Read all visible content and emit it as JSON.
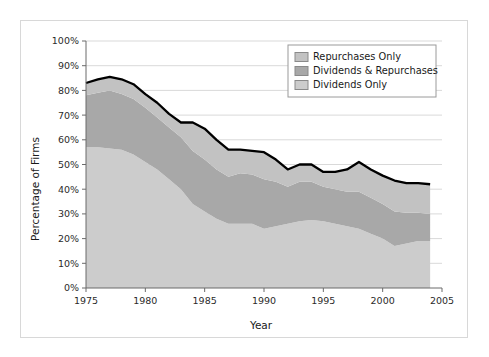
{
  "figure": {
    "background": "#ffffff",
    "border_color": "#d8d8d8"
  },
  "axis": {
    "y_title": "Percentage of Firms",
    "x_title": "Year",
    "y_ticks": [
      "0%",
      "10%",
      "20%",
      "30%",
      "40%",
      "50%",
      "60%",
      "70%",
      "80%",
      "90%",
      "100%"
    ],
    "x_ticks": [
      "1975",
      "1980",
      "1985",
      "1990",
      "1995",
      "2000",
      "2005"
    ]
  },
  "legend": {
    "position": "top-right",
    "items": [
      {
        "label": "Repurchases Only",
        "color": "#c2c2c2"
      },
      {
        "label": "Dividends & Repurchases",
        "color": "#a8a8a8"
      },
      {
        "label": "Dividends Only",
        "color": "#cccccc"
      }
    ]
  },
  "chart_data": {
    "type": "area",
    "stacked": true,
    "title": "",
    "xlabel": "Year",
    "ylabel": "Percentage of Firms",
    "xlim": [
      1975,
      2005
    ],
    "ylim": [
      0,
      100
    ],
    "y_unit": "percent",
    "grid": "horizontal",
    "legend_position": "top-right",
    "x": [
      1975,
      1976,
      1977,
      1978,
      1979,
      1980,
      1981,
      1982,
      1983,
      1984,
      1985,
      1986,
      1987,
      1988,
      1989,
      1990,
      1991,
      1992,
      1993,
      1994,
      1995,
      1996,
      1997,
      1998,
      1999,
      2000,
      2001,
      2002,
      2003,
      2004
    ],
    "series": [
      {
        "name": "Dividends Only",
        "color": "#cccccc",
        "values": [
          57.0,
          57.0,
          56.5,
          56.0,
          54.0,
          51.0,
          48.0,
          44.0,
          40.0,
          34.0,
          31.0,
          28.0,
          26.0,
          26.0,
          26.0,
          24.0,
          25.0,
          26.0,
          27.0,
          27.5,
          27.0,
          26.0,
          25.0,
          24.0,
          22.0,
          20.0,
          17.0,
          18.0,
          19.0,
          19.0
        ]
      },
      {
        "name": "Dividends & Repurchases",
        "color": "#a8a8a8",
        "values": [
          21.0,
          22.0,
          23.5,
          22.5,
          22.5,
          22.0,
          21.0,
          21.0,
          21.0,
          21.5,
          21.0,
          20.0,
          19.0,
          20.5,
          20.0,
          20.0,
          18.0,
          15.0,
          16.0,
          15.5,
          14.0,
          14.0,
          14.0,
          15.0,
          14.5,
          14.0,
          14.0,
          12.5,
          11.5,
          11.0
        ]
      },
      {
        "name": "Repurchases Only",
        "color": "#c2c2c2",
        "values": [
          5.0,
          5.5,
          5.5,
          6.0,
          6.0,
          5.5,
          6.0,
          5.5,
          6.0,
          11.5,
          12.5,
          12.0,
          11.0,
          9.5,
          9.5,
          11.0,
          9.0,
          7.0,
          7.0,
          7.0,
          6.0,
          7.0,
          9.0,
          12.0,
          11.5,
          11.5,
          12.5,
          12.0,
          12.0,
          12.0
        ]
      }
    ],
    "total_line": {
      "name": "Total (outline)",
      "color": "#000000",
      "values": [
        83.0,
        84.5,
        85.5,
        84.5,
        82.5,
        78.5,
        75.0,
        70.5,
        67.0,
        67.0,
        64.5,
        60.0,
        56.0,
        56.0,
        55.5,
        55.0,
        52.0,
        48.0,
        50.0,
        50.0,
        47.0,
        47.0,
        48.0,
        51.0,
        48.0,
        45.5,
        43.5,
        42.5,
        42.5,
        42.0
      ]
    }
  }
}
